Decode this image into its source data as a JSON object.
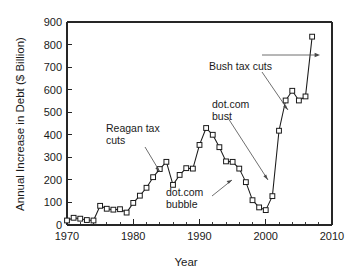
{
  "chart_data": {
    "type": "line",
    "title": "",
    "xlabel": "Year",
    "ylabel": "Annual Increase in Debt ($ Billion)",
    "xlim": [
      1970,
      2010
    ],
    "ylim": [
      0,
      900
    ],
    "xticks": [
      1970,
      1980,
      1990,
      2000,
      2010
    ],
    "xtick_labels": [
      "1970",
      "1980",
      "1990",
      "2000",
      "2010"
    ],
    "xminor_step": 2,
    "yticks": [
      0,
      100,
      200,
      300,
      400,
      500,
      600,
      700,
      800,
      900
    ],
    "ytick_labels": [
      "0",
      "100",
      "200",
      "300",
      "400",
      "500",
      "600",
      "700",
      "800",
      "900"
    ],
    "grid": false,
    "legend": "none",
    "marker": "open-square",
    "line_color": "#1a1a1a",
    "marker_face_color": "#ffffff",
    "x": [
      1970,
      1971,
      1972,
      1973,
      1974,
      1975,
      1976,
      1977,
      1978,
      1979,
      1980,
      1981,
      1982,
      1983,
      1984,
      1985,
      1986,
      1987,
      1988,
      1989,
      1990,
      1991,
      1992,
      1993,
      1994,
      1995,
      1996,
      1997,
      1998,
      1999,
      2000,
      2001,
      2002,
      2003,
      2004,
      2005,
      2006,
      2007
    ],
    "values": [
      20,
      32,
      28,
      22,
      20,
      85,
      72,
      68,
      70,
      55,
      98,
      130,
      165,
      212,
      248,
      280,
      178,
      222,
      252,
      250,
      355,
      430,
      400,
      345,
      282,
      280,
      250,
      190,
      110,
      78,
      66,
      128,
      418,
      552,
      595,
      552,
      570,
      835
    ],
    "annotations": [
      {
        "label": "Reagan tax cuts",
        "points_to_year": 1983,
        "points_to_value": 212
      },
      {
        "label": "dot.com bubble",
        "points_to_year": 1997,
        "points_to_value": 190
      },
      {
        "label": "dot.com bust",
        "points_to_year": 2001,
        "points_to_value": 128
      },
      {
        "label": "Bush tax cuts",
        "points_to_year": 2003,
        "points_to_value": 552
      }
    ],
    "span_marker": {
      "label": "",
      "from_year": 2001,
      "to_year": 2007,
      "at_value": 735
    }
  },
  "annotation_text": {
    "reagan_line1": "Reagan tax",
    "reagan_line2": "cuts",
    "dotcom_bubble_line1": "dot.com",
    "dotcom_bubble_line2": "bubble",
    "dotcom_bust_line1": "dot.com",
    "dotcom_bust_line2": "bust",
    "bush": "Bush tax cuts"
  },
  "axes": {
    "ylabel": "Annual Increase in Debt ($ Billion)",
    "xlabel": "Year"
  }
}
